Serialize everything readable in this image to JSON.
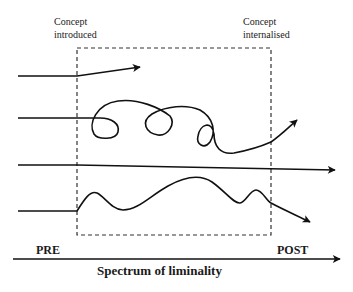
{
  "labels": {
    "start_marker": {
      "line1": "Concept",
      "line2": "introduced"
    },
    "end_marker": {
      "line1": "Concept",
      "line2": "internalised"
    },
    "pre": "PRE",
    "post": "POST",
    "axis_title": "Spectrum of liminality"
  },
  "colors": {
    "stroke": "#111111",
    "dashed_box": "#333333",
    "background": "#ffffff"
  },
  "paths": [
    {
      "name": "path-short-exit",
      "description": "Straight line entering, deviates upward and stops early inside the liminal space"
    },
    {
      "name": "path-looping",
      "description": "Line entering, oscillates with several loops, exits upward past POST boundary"
    },
    {
      "name": "path-straight",
      "description": "Straight line passing directly through the liminal space"
    },
    {
      "name": "path-wavy",
      "description": "Line entering, wavy oscillation, exits downward past POST boundary"
    }
  ]
}
